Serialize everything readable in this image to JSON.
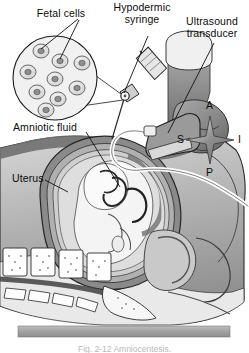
{
  "figure": {
    "title_caption": "Fig. 2-12  Amniocentesis.",
    "labels": [
      {
        "id": "fetal-cells",
        "text": "Fetal cells"
      },
      {
        "id": "hypodermic-syringe",
        "text": "Hypodermic\nsyringe"
      },
      {
        "id": "ultrasound-transducer",
        "text": "Ultrasound\ntransducer"
      },
      {
        "id": "amniotic-fluid",
        "text": "Amniotic fluid"
      },
      {
        "id": "uterus",
        "text": "Uterus"
      }
    ],
    "compass": {
      "anterior": "A",
      "superior": "S",
      "inferior": "I",
      "posterior": "P"
    },
    "inset": {
      "name": "fetal-cell-inset",
      "cell_count": 9
    },
    "colors": {
      "outline": "#1a1a1a",
      "skin_mid": "#9b9b9b",
      "skin_dark": "#6e6e6e",
      "uterus_wall": "#8a8a8a",
      "amniotic_fluid": "#dcdcdc",
      "fetus": "#f2f2f2",
      "bone": "#ffffff",
      "table": "#a8a8a8",
      "background": "#ffffff"
    }
  }
}
